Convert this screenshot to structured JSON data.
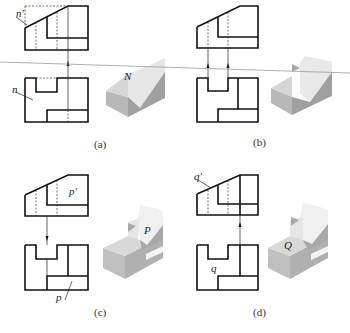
{
  "figure": {
    "panels": [
      {
        "id": "a",
        "caption": "(a)",
        "top_label": "n'",
        "bottom_label": "n",
        "iso_label": "N"
      },
      {
        "id": "b",
        "caption": "(b)"
      },
      {
        "id": "c",
        "caption": "(c)",
        "top_label": "p'",
        "bottom_label": "p",
        "iso_label": "P"
      },
      {
        "id": "d",
        "caption": "(d)",
        "top_label": "q'",
        "bottom_label": "q",
        "iso_label": "Q"
      }
    ],
    "colors": {
      "line": "#111111",
      "face_dark": "#a8a8a8",
      "face_mid": "#c8c8c8",
      "face_light": "#e6e6e6",
      "scan_line": "#9a9a9a"
    }
  }
}
